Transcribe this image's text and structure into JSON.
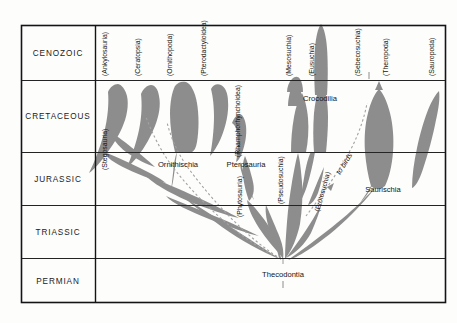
{
  "figure": {
    "type": "spindle-diagram",
    "background_color": "#fdfdfc",
    "frame_color": "#141414",
    "grid_color": "#222222",
    "spindle_fill": "#8d8d8d",
    "dashed_color": "#9a9a9a"
  },
  "axis": {
    "label": "Geologic period",
    "periods": [
      {
        "name": "CENOZOIC",
        "top_px": 25,
        "bottom_px": 80
      },
      {
        "name": "CRETACEOUS",
        "top_px": 80,
        "bottom_px": 152
      },
      {
        "name": "JURASSIC",
        "top_px": 152,
        "bottom_px": 205
      },
      {
        "name": "TRIASSIC",
        "top_px": 205,
        "bottom_px": 258
      },
      {
        "name": "PERMIAN",
        "top_px": 258,
        "bottom_px": 303
      }
    ]
  },
  "major_groups": [
    {
      "name": "Ornithischia",
      "x_px": 178,
      "y_px": 165
    },
    {
      "name": "Pterosauria",
      "x_px": 245,
      "y_px": 165
    },
    {
      "name": "Crocodilia",
      "x_px": 320,
      "y_px": 100
    },
    {
      "name": "Saurischia",
      "x_px": 378,
      "y_px": 190
    },
    {
      "name": "Thecodontia",
      "x_px": 283,
      "y_px": 275
    }
  ],
  "subgroup_labels": [
    {
      "name": "(Ankylosauria)",
      "x_px": 107,
      "y_px": 76
    },
    {
      "name": "(Ceratopsia)",
      "x_px": 140,
      "y_px": 76
    },
    {
      "name": "(Ornithopoda)",
      "x_px": 172,
      "y_px": 76
    },
    {
      "name": "(Pterodactyloidea)",
      "x_px": 206,
      "y_px": 76
    },
    {
      "name": "(Stegosauria)",
      "x_px": 107,
      "y_px": 168
    },
    {
      "name": "(Rhamphorhynchoidea)",
      "x_px": 243,
      "y_px": 150
    },
    {
      "name": "(Mesosuchia)",
      "x_px": 291,
      "y_px": 76
    },
    {
      "name": "(Eusuchia)",
      "x_px": 314,
      "y_px": 76
    },
    {
      "name": "(Sebecosuchia)",
      "x_px": 360,
      "y_px": 76
    },
    {
      "name": "(Theropoda)",
      "x_px": 388,
      "y_px": 76
    },
    {
      "name": "(Sauropoda)",
      "x_px": 434,
      "y_px": 76
    },
    {
      "name": "(Phytosauria)",
      "x_px": 245,
      "y_px": 205
    },
    {
      "name": "(Pseudosuchia)",
      "x_px": 283,
      "y_px": 185
    },
    {
      "name": "(Protosuchia)",
      "x_px": 325,
      "y_px": 190
    }
  ],
  "annotations": [
    {
      "name": "to birds",
      "x_px": 348,
      "y_px": 160
    }
  ]
}
